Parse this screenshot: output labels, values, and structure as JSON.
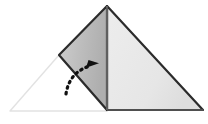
{
  "figure": {
    "canvas": {
      "width": 208,
      "height": 124,
      "background": "#ffffff"
    },
    "colors": {
      "outline_stroke": "#2b2b2b",
      "flap_fill_light": "#c9c9c9",
      "flap_fill_dark": "#b0b0b0",
      "panel_fill": "#e9e9e9",
      "panel_fill_edge": "#dedede",
      "ghost_stroke": "#e2e2e2",
      "arrow_color": "#111111",
      "crease_stroke": "#6e6e6e"
    },
    "shapes": {
      "ghost_triangle": {
        "name": "unfolded-ghost-outline",
        "points": "10,111 59,55 107,111",
        "stroke": "#e2e2e2",
        "stroke_width": 1.4,
        "fill": "none"
      },
      "right_panel": {
        "name": "right-panel",
        "points": "107,6 203,110 107,110",
        "fill": "#e9e9e9",
        "stroke": "#2b2b2b",
        "stroke_width": 2.2
      },
      "folded_flap": {
        "name": "folded-flap",
        "points": "107,6 59,55 107,110",
        "fill": "#bdbdbd",
        "stroke": "#2b2b2b",
        "stroke_width": 2.2
      },
      "crease_line": {
        "name": "center-crease-line",
        "x1": 107,
        "y1": 6,
        "x2": 107,
        "y2": 110,
        "stroke": "#6e6e6e",
        "stroke_width": 1.6
      },
      "base_line": {
        "name": "base-edge-line",
        "x1": 107,
        "y1": 110,
        "x2": 203,
        "y2": 110,
        "stroke": "#5c5c5c",
        "stroke_width": 1.6
      }
    },
    "arrow": {
      "name": "fold-direction-arrow",
      "style": "dotted-curved",
      "path": "M 66,94 C 68,80 76,70 90,66",
      "dash_pattern": "1.6 4.2",
      "stroke_width": 3.2,
      "head_points": "99,63.2 86,67.8 88.5,60.0",
      "color": "#111111",
      "direction": "up-and-right"
    },
    "labels": {
      "caption": "",
      "step_number": ""
    }
  }
}
